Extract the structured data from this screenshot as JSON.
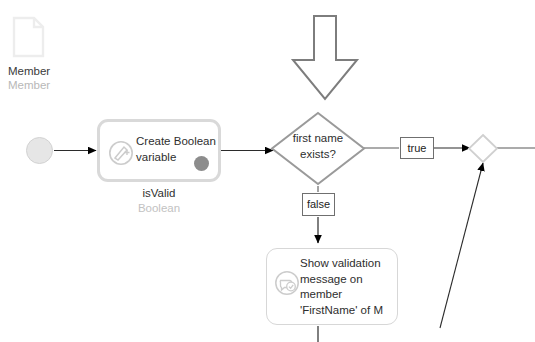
{
  "diagram": {
    "type": "microflow",
    "parameter": {
      "icon": "entity-page-icon",
      "name": "Member",
      "type": "Member"
    },
    "start_event": {
      "icon": "start-event-circle"
    },
    "activities": [
      {
        "id": "create-boolean-variable",
        "icon": "create-variable-icon",
        "label": "Create Boolean\nvariable",
        "label_line1": "Create Boolean",
        "label_line2": "variable",
        "output_name": "isValid",
        "output_type": "Boolean"
      },
      {
        "id": "show-validation-message",
        "icon": "validation-message-icon",
        "label_line1": "Show validation",
        "label_line2": "message on",
        "label_line3": "member",
        "label_line4": "'FirstName' of M"
      }
    ],
    "decision": {
      "id": "first-name-exists-decision",
      "line1": "first name",
      "line2": "exists?"
    },
    "flow_labels": {
      "true": "true",
      "false": "false"
    },
    "merge": {
      "id": "merge-gateway"
    },
    "annotation": {
      "id": "pointer-arrow",
      "direction": "down"
    },
    "colors": {
      "stroke": "#6f6f6f",
      "activity_border": "#d7d7d7",
      "diamond_border": "#9a9a9a",
      "text": "#2e2e2e",
      "muted_text": "#b8b8b8",
      "dot_fill": "#8c8c8c",
      "start_fill": "#e6e6e6",
      "arrow_fill": "#000000"
    }
  }
}
